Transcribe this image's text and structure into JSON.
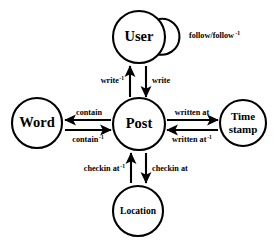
{
  "diagram": {
    "background_color": "#ffffff",
    "stroke_color": "#000000",
    "nodes": [
      {
        "id": "user",
        "label": "User",
        "cx": 139,
        "cy": 37,
        "r": 26,
        "size": "big"
      },
      {
        "id": "post",
        "label": "Post",
        "cx": 139,
        "cy": 124,
        "r": 26,
        "size": "big"
      },
      {
        "id": "word",
        "label": "Word",
        "cx": 37,
        "cy": 123,
        "r": 25,
        "size": "big"
      },
      {
        "id": "timestamp",
        "label": "Time\nstamp",
        "cx": 243,
        "cy": 123,
        "r": 23,
        "size": "mid"
      },
      {
        "id": "location",
        "label": "Location",
        "cx": 138,
        "cy": 211,
        "r": 25,
        "size": "small"
      }
    ],
    "edges": [
      {
        "id": "follow",
        "from": "user",
        "to": "user",
        "label": "follow/follow",
        "superscript": "-1",
        "type": "self-loop"
      },
      {
        "id": "write-inverse",
        "from": "post",
        "to": "user",
        "label": "write",
        "superscript": "-1",
        "direction": "up"
      },
      {
        "id": "write",
        "from": "user",
        "to": "post",
        "label": "write",
        "superscript": "",
        "direction": "down"
      },
      {
        "id": "contain",
        "from": "post",
        "to": "word",
        "label": "contain",
        "superscript": "",
        "direction": "left"
      },
      {
        "id": "contain-inverse",
        "from": "word",
        "to": "post",
        "label": "contain",
        "superscript": "-1",
        "direction": "right"
      },
      {
        "id": "written-at",
        "from": "post",
        "to": "timestamp",
        "label": "written at",
        "superscript": "",
        "direction": "right"
      },
      {
        "id": "written-at-inverse",
        "from": "timestamp",
        "to": "post",
        "label": "written at",
        "superscript": "-1",
        "direction": "left"
      },
      {
        "id": "checkin-at-inverse",
        "from": "location",
        "to": "post",
        "label": "checkin at",
        "superscript": "-1",
        "direction": "up"
      },
      {
        "id": "checkin-at",
        "from": "post",
        "to": "location",
        "label": "checkin at",
        "superscript": "",
        "direction": "down"
      }
    ],
    "node_labels": {
      "user": "User",
      "post": "Post",
      "word": "Word",
      "timestamp_line1": "Time",
      "timestamp_line2": "stamp",
      "location": "Location"
    },
    "edge_labels": {
      "follow": "follow/follow",
      "follow_sup": "-1",
      "write_inverse": "write",
      "write_inverse_sup": "-1",
      "write": "write",
      "contain": "contain",
      "contain_inverse": "contain",
      "contain_inverse_sup": "-1",
      "written_at": "written at",
      "written_at_inverse": "written at",
      "written_at_inverse_sup": "-1",
      "checkin_at_inverse": "checkin at",
      "checkin_at_inverse_sup": "-1",
      "checkin_at": "checkin at"
    }
  }
}
